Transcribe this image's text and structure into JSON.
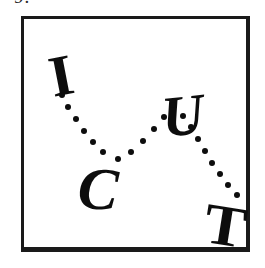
{
  "figure": {
    "caption_fragment": "9.",
    "background_color": "#ffffff",
    "ink_color": "#0d0d0d",
    "border_color": "#1a1a1a",
    "frame": {
      "x": 21,
      "y": 16,
      "width": 229,
      "height": 236
    }
  },
  "chart_data": {
    "type": "scatter",
    "title": "",
    "subtitle": "",
    "xlabel": "",
    "ylabel": "",
    "grid": false,
    "legend": null,
    "axis_ranges": {
      "xlim": [
        0,
        229
      ],
      "ylim": [
        0,
        236
      ]
    },
    "annotations": [
      "I",
      "C",
      "U",
      "T"
    ],
    "note": "Four bold serif letters placed in a zigzag (down-up-down) path, joined by dotted trails.",
    "letters": [
      {
        "label": "I",
        "x": 48,
        "y": 55,
        "rotation": -11,
        "font_size": 58,
        "italic": false
      },
      {
        "label": "C",
        "x": 80,
        "y": 170,
        "rotation": 4,
        "font_size": 60,
        "italic": true
      },
      {
        "label": "U",
        "x": 162,
        "y": 96,
        "rotation": -6,
        "font_size": 58,
        "italic": true
      },
      {
        "label": "T",
        "x": 208,
        "y": 206,
        "rotation": 9,
        "font_size": 58,
        "italic": false
      }
    ],
    "series": [
      {
        "name": "trail-i-to-c",
        "from": "I",
        "to": "C",
        "dot_count": 6,
        "dot_radius": 3.4,
        "points": [
          [
            38,
            76
          ],
          [
            44,
            88
          ],
          [
            52,
            100
          ],
          [
            60,
            112
          ],
          [
            69,
            123
          ],
          [
            79,
            133
          ]
        ]
      },
      {
        "name": "trail-c-to-u",
        "from": "C",
        "to": "U",
        "dot_count": 6,
        "dot_radius": 3.4,
        "points": [
          [
            94,
            140
          ],
          [
            107,
            133
          ],
          [
            119,
            122
          ],
          [
            130,
            110
          ],
          [
            140,
            98
          ],
          [
            149,
            86
          ]
        ]
      },
      {
        "name": "trail-u-to-t",
        "from": "U",
        "to": "T",
        "dot_count": 8,
        "dot_radius": 3.4,
        "points": [
          [
            159,
            97
          ],
          [
            167,
            108
          ],
          [
            174,
            120
          ],
          [
            181,
            132
          ],
          [
            188,
            144
          ],
          [
            196,
            155
          ],
          [
            204,
            166
          ],
          [
            213,
            176
          ]
        ]
      }
    ]
  }
}
